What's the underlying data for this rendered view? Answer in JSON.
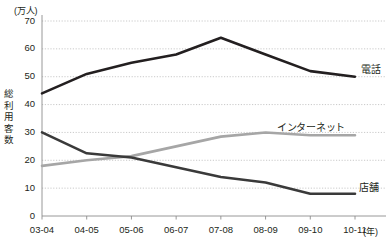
{
  "chart_data": {
    "type": "line",
    "title": "",
    "subtitle": "",
    "xlabel": "(年)",
    "ylabel": "総利用客数",
    "yunit": "(万人)",
    "ylim": [
      0,
      70
    ],
    "ytick_step": 10,
    "grid": true,
    "grid_style": "dotted-horizontal",
    "legend_position": "inline-right-of-line-end",
    "categories": [
      "03-04",
      "04-05",
      "05-06",
      "06-07",
      "07-08",
      "08-09",
      "09-10",
      "10-11"
    ],
    "yticks": [
      "0",
      "10",
      "20",
      "30",
      "40",
      "50",
      "60",
      "70"
    ],
    "series": [
      {
        "name": "電話",
        "color": "#231f20",
        "width": 2.6,
        "values": [
          44,
          51,
          55,
          58,
          64,
          58,
          52,
          50
        ]
      },
      {
        "name": "インターネット",
        "color": "#a6a6a6",
        "width": 2.6,
        "values": [
          18,
          20,
          21.5,
          25,
          28.5,
          30,
          29,
          29
        ]
      },
      {
        "name": "店舗",
        "color": "#3a3a3a",
        "width": 2.6,
        "values": [
          30,
          22.5,
          21,
          17.5,
          14,
          12,
          8,
          8
        ]
      }
    ]
  },
  "axis": {
    "yunit_label": "(万人)",
    "yaxis_title_chars": [
      "総",
      "利",
      "用",
      "客",
      "数"
    ],
    "xunit_label": "(年)"
  },
  "colors": {
    "telephone": "#231f20",
    "internet": "#a6a6a6",
    "store": "#3a3a3a",
    "grid": "#bdbdbd",
    "axis": "#8c8c8c",
    "text": "#231f20",
    "background": "#ffffff"
  }
}
